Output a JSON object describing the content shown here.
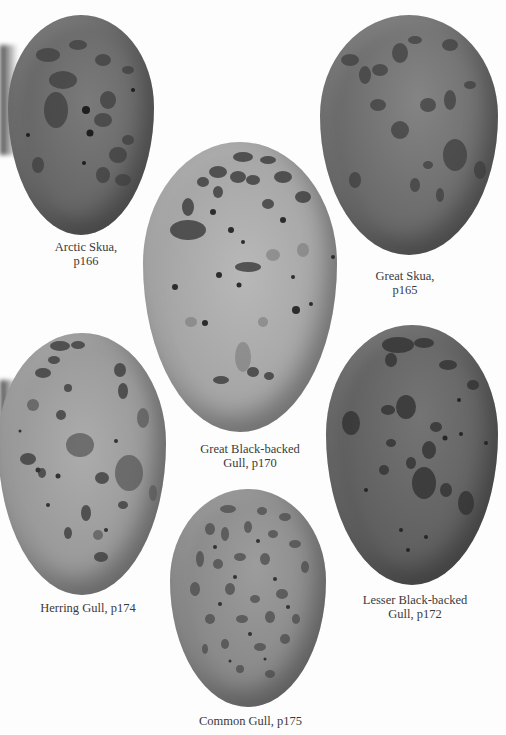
{
  "plate": {
    "description": "Illustrated plate of six speckled seabird eggs with captions",
    "eggs": [
      {
        "id": "arctic-skua",
        "caption_line1": "Arctic Skua,",
        "caption_line2": "p166",
        "species": "Arctic Skua",
        "page": "p166",
        "tone": "#6a6a6a"
      },
      {
        "id": "great-skua",
        "caption_line1": "Great Skua,",
        "caption_line2": "p165",
        "species": "Great Skua",
        "page": "p165",
        "tone": "#6e6e6e"
      },
      {
        "id": "great-black-backed-gull",
        "caption_line1": "Great Black-backed",
        "caption_line2": "Gull, p170",
        "species": "Great Black-backed Gull",
        "page": "p170",
        "tone": "#a9a9a9"
      },
      {
        "id": "herring-gull",
        "caption_line1": "Herring Gull, p174",
        "caption_line2": "",
        "species": "Herring Gull",
        "page": "p174",
        "tone": "#9c9c9c"
      },
      {
        "id": "lesser-black-backed-gull",
        "caption_line1": "Lesser Black-backed",
        "caption_line2": "Gull, p172",
        "species": "Lesser Black-backed Gull",
        "page": "p172",
        "tone": "#5f5f5f"
      },
      {
        "id": "common-gull",
        "caption_line1": "Common Gull, p175",
        "caption_line2": "",
        "species": "Common Gull",
        "page": "p175",
        "tone": "#8d8d8d"
      }
    ]
  }
}
